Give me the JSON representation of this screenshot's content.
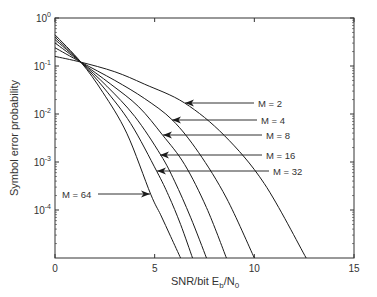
{
  "chart_data": {
    "type": "line",
    "title": "",
    "xlabel": "SNR/bit E_b/N_0",
    "xlabel_parts": {
      "main": "SNR/bit E",
      "sub1": "b",
      "mid": "/N",
      "sub2": "0"
    },
    "ylabel": "Symbol error probability",
    "xlim": [
      0,
      15
    ],
    "ylim": [
      1e-05,
      1
    ],
    "yscale": "log",
    "x_ticks": [
      0,
      5,
      10,
      15
    ],
    "x_tick_labels": [
      "0",
      "5",
      "10",
      "15"
    ],
    "y_ticks": [
      0,
      -1,
      -2,
      -3,
      -4
    ],
    "y_tick_labels": [
      {
        "base": "10",
        "exp": "0"
      },
      {
        "base": "10",
        "exp": "-1"
      },
      {
        "base": "10",
        "exp": "-2"
      },
      {
        "base": "10",
        "exp": "-3"
      },
      {
        "base": "10",
        "exp": "-4"
      }
    ],
    "grid": false,
    "legend": "none (inline annotations with arrows)",
    "series": [
      {
        "name": "M = 2",
        "x": [
          0,
          1.3,
          3,
          4.5,
          6.5,
          8.5,
          10.5,
          12.6
        ],
        "log10_y": [
          -0.8,
          -0.92,
          -1.12,
          -1.38,
          -1.77,
          -2.45,
          -3.45,
          -5.0
        ]
      },
      {
        "name": "M = 4",
        "x": [
          0,
          1.3,
          3,
          4.5,
          5.9,
          7.2,
          8.6,
          10.0
        ],
        "log10_y": [
          -0.62,
          -0.92,
          -1.3,
          -1.68,
          -2.13,
          -2.8,
          -3.75,
          -5.0
        ]
      },
      {
        "name": "M = 8",
        "x": [
          0,
          1.3,
          2.8,
          4.2,
          5.4,
          6.5,
          7.6,
          8.6
        ],
        "log10_y": [
          -0.52,
          -0.92,
          -1.38,
          -1.85,
          -2.44,
          -3.05,
          -3.95,
          -5.0
        ]
      },
      {
        "name": "M = 16",
        "x": [
          0,
          1.3,
          2.6,
          4.0,
          5.3,
          6.0,
          6.8,
          7.6
        ],
        "log10_y": [
          -0.45,
          -0.92,
          -1.42,
          -2.05,
          -2.85,
          -3.4,
          -4.15,
          -5.0
        ]
      },
      {
        "name": "M = 32",
        "x": [
          0,
          1.3,
          2.5,
          3.8,
          5.1,
          5.7,
          6.3,
          6.9
        ],
        "log10_y": [
          -0.4,
          -0.92,
          -1.48,
          -2.2,
          -3.19,
          -3.7,
          -4.3,
          -5.0
        ]
      },
      {
        "name": "M = 64",
        "x": [
          0,
          1.3,
          2.4,
          3.6,
          4.8,
          5.3,
          5.8,
          6.3
        ],
        "log10_y": [
          -0.35,
          -0.92,
          -1.55,
          -2.4,
          -3.67,
          -4.1,
          -4.55,
          -5.0
        ]
      }
    ],
    "annotations": [
      {
        "text": "M = 2",
        "label_px": [
          258,
          103
        ],
        "arrow_to_px": [
          185,
          103
        ],
        "side": "right"
      },
      {
        "text": "M = 4",
        "label_px": [
          261,
          120
        ],
        "arrow_to_px": [
          172,
          120
        ],
        "side": "right"
      },
      {
        "text": "M = 8",
        "label_px": [
          266,
          135
        ],
        "arrow_to_px": [
          163,
          135
        ],
        "side": "right"
      },
      {
        "text": "M = 16",
        "label_px": [
          266,
          155
        ],
        "arrow_to_px": [
          160,
          155
        ],
        "side": "right"
      },
      {
        "text": "M = 32",
        "label_px": [
          273,
          171
        ],
        "arrow_to_px": [
          157,
          171
        ],
        "side": "right"
      },
      {
        "text": "M = 64",
        "label_px": [
          62,
          194
        ],
        "arrow_to_px": [
          150,
          194
        ],
        "side": "left"
      }
    ]
  },
  "plot_box": {
    "left": 55,
    "top": 18,
    "right": 354,
    "bottom": 258
  },
  "colors": {
    "line": "#1a1a1a",
    "axis": "#333333",
    "text": "#333333",
    "background": "#ffffff"
  }
}
